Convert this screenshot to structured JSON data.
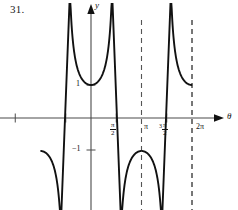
{
  "exercise": {
    "number": "31."
  },
  "axes": {
    "y_axis_label": "y",
    "x_axis_label": "θ",
    "x_ticks": [
      {
        "label": "",
        "pi_value": -1.5,
        "x": 14
      },
      {
        "label": "",
        "pi_value": -0.5,
        "x": 66
      },
      {
        "label": "π/2",
        "num": "π",
        "den": "2",
        "prefix": "",
        "pi_value": 0.5,
        "x": 116
      },
      {
        "label": "π",
        "plain": "π",
        "pi_value": 1.0,
        "x": 141
      },
      {
        "label": "3π/2",
        "num": "π",
        "den": "2",
        "prefix": "3",
        "pi_value": 1.5,
        "x": 167
      },
      {
        "label": "2π",
        "plain": "2π",
        "pi_value": 2.0,
        "x": 192
      }
    ],
    "y_ticks": [
      {
        "label": "1",
        "value": 1,
        "y": 85
      },
      {
        "label": "−1",
        "value": -1,
        "y": 150
      }
    ],
    "origin": {
      "x": 91,
      "y": 118
    },
    "pi_pixels": 50.5
  },
  "asymptotes": [
    {
      "label": "−π",
      "x": 40
    },
    {
      "label": "π",
      "x": 141
    },
    {
      "label": "2π",
      "x": 192
    }
  ],
  "colors": {
    "curve": "#111111",
    "axis": "#4a4a4a",
    "asymptote": "#555555",
    "background": "#ffffff",
    "text": "#111111"
  },
  "chart_data": {
    "type": "line",
    "title": "",
    "function": "y = sec θ",
    "xlabel": "θ",
    "ylabel": "y",
    "xlim": [
      -1.8,
      2.35
    ],
    "ylim": [
      -2.9,
      2.9
    ],
    "xunit": "pi",
    "grid": false,
    "legend": null,
    "xtick_labels": [
      "π/2",
      "π",
      "3π/2",
      "2π"
    ],
    "xtick_values": [
      0.5,
      1.0,
      1.5,
      2.0
    ],
    "ytick_labels": [
      "1",
      "−1"
    ],
    "ytick_values": [
      1,
      -1
    ],
    "asymptotes_x": [
      -1.0,
      1.0,
      2.0
    ],
    "branches": [
      {
        "name": "upper-branch-0-to-pi",
        "domain_pi": [
          0.0,
          1.0
        ],
        "vertex": {
          "x_pi": 0.5,
          "y": 1
        },
        "direction": "up"
      },
      {
        "name": "lower-branch-minus-pi-to-0",
        "domain_pi": [
          -1.0,
          0.0
        ],
        "vertex": {
          "x_pi": -0.5,
          "y": -1
        },
        "direction": "down"
      },
      {
        "name": "lower-branch-pi-to-2pi",
        "domain_pi": [
          1.0,
          2.0
        ],
        "vertex": {
          "x_pi": 1.5,
          "y": -1
        },
        "direction": "down"
      }
    ]
  }
}
